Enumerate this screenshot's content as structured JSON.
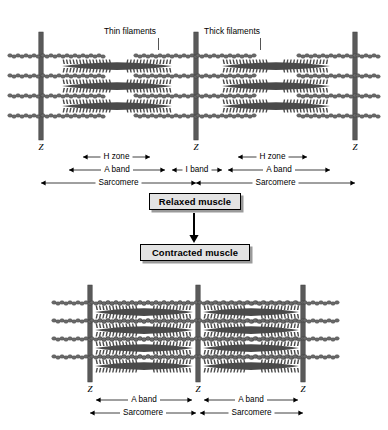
{
  "figure": {
    "colors": {
      "z_line": "#5a5a5a",
      "thick_filament": "#4a4a4a",
      "thin_filament": "#6b6b6b",
      "box_fill": "#e3e3e3",
      "box_border": "#000000",
      "box_shadow": "#9a9a9a",
      "text": "#000000",
      "background": "#ffffff"
    },
    "callouts": [
      {
        "text": "Thin filaments",
        "x": 130,
        "y": 27
      },
      {
        "text": "Thick filaments",
        "x": 232,
        "y": 27
      }
    ],
    "relaxed": {
      "label": "Relaxed muscle",
      "z_lines": [
        {
          "label": "Z",
          "x": 41
        },
        {
          "label": "Z",
          "x": 196
        },
        {
          "label": "Z",
          "x": 355
        }
      ],
      "measures": [
        {
          "name": "H zone",
          "label": "H zone",
          "x1": 83,
          "x2": 150,
          "row": 0
        },
        {
          "name": "H zone",
          "label": "H zone",
          "x1": 238,
          "x2": 307,
          "row": 0
        },
        {
          "name": "A band",
          "label": "A band",
          "x1": 69,
          "x2": 165,
          "row": 1
        },
        {
          "name": "I band",
          "label": "I band",
          "x1": 172,
          "x2": 222,
          "row": 1
        },
        {
          "name": "A band",
          "label": "A band",
          "x1": 228,
          "x2": 330,
          "row": 1
        },
        {
          "name": "Sarcomere",
          "label": "Sarcomere",
          "x1": 41,
          "x2": 196,
          "row": 2
        },
        {
          "name": "Sarcomere",
          "label": "Sarcomere",
          "x1": 196,
          "x2": 355,
          "row": 2
        }
      ]
    },
    "contracted": {
      "label": "Contracted muscle",
      "z_lines": [
        {
          "label": "Z",
          "x": 90
        },
        {
          "label": "Z",
          "x": 198
        },
        {
          "label": "Z",
          "x": 303
        }
      ],
      "measures": [
        {
          "name": "A band",
          "label": "A band",
          "x1": 96,
          "x2": 192,
          "row": 0
        },
        {
          "name": "A band",
          "label": "A band",
          "x1": 204,
          "x2": 298,
          "row": 0
        },
        {
          "name": "Sarcomere",
          "label": "Sarcomere",
          "x1": 90,
          "x2": 196,
          "row": 1
        },
        {
          "name": "Sarcomere",
          "label": "Sarcomere",
          "x1": 200,
          "x2": 303,
          "row": 1
        }
      ]
    }
  }
}
